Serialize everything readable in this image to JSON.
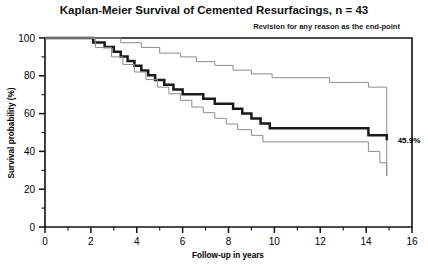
{
  "chart_data": {
    "type": "line",
    "title": "Kaplan-Meier Survival of Cemented Resurfacings, n = 43",
    "subtitle": "Revision for any reason as the end-point",
    "xlabel": "Follow-up in years",
    "ylabel": "Survival probability (%)",
    "xlim": [
      0,
      16
    ],
    "ylim": [
      0,
      100
    ],
    "x_ticks": [
      0,
      2,
      4,
      6,
      8,
      10,
      12,
      14,
      16
    ],
    "x_tick_labels": [
      "0",
      "2",
      "4",
      "6",
      "8",
      "10",
      "12",
      "14",
      "16"
    ],
    "x_minor_step": 1,
    "y_ticks": [
      0,
      20,
      40,
      60,
      80,
      100
    ],
    "y_tick_labels": [
      "0",
      "20",
      "40",
      "60",
      "80",
      "100"
    ],
    "y_minor_step": 10,
    "grid": false,
    "legend": "none",
    "step_type": "post",
    "annotations": [
      {
        "name": "final-survival-label",
        "text": "45.9%",
        "x": 15.2,
        "y": 45.9
      }
    ],
    "series": [
      {
        "name": "Survival estimate",
        "role": "estimate",
        "style": "bold",
        "color": "#1a1a1a",
        "final_value": 45.9,
        "x": [
          0.0,
          1.75,
          2.1,
          2.6,
          3.0,
          3.3,
          3.6,
          3.9,
          4.2,
          4.5,
          4.8,
          5.2,
          5.6,
          6.0,
          6.4,
          6.9,
          7.4,
          7.8,
          8.2,
          8.6,
          9.0,
          9.4,
          9.8,
          11.3,
          13.6,
          14.1,
          14.9
        ],
        "y": [
          100.0,
          100.0,
          97.6,
          95.2,
          92.7,
          90.2,
          87.8,
          85.3,
          82.8,
          80.3,
          77.8,
          75.3,
          72.8,
          70.3,
          70.3,
          67.8,
          65.2,
          65.2,
          62.6,
          60.0,
          57.4,
          54.8,
          52.2,
          52.2,
          52.2,
          48.5,
          45.9
        ]
      },
      {
        "name": "Upper 95% confidence limit",
        "role": "upper-ci",
        "style": "thin",
        "color": "#8d8d8d",
        "final_value": 71.5,
        "x": [
          0.0,
          2.6,
          3.3,
          4.2,
          5.0,
          5.9,
          6.6,
          7.4,
          8.2,
          9.0,
          9.9,
          11.3,
          12.4,
          13.6,
          14.1,
          14.9
        ],
        "y": [
          100.0,
          100.0,
          97.5,
          95.0,
          92.0,
          90.0,
          87.5,
          85.5,
          83.0,
          81.0,
          79.0,
          79.0,
          76.5,
          76.5,
          74.0,
          71.5
        ]
      },
      {
        "name": "Lower 95% confidence limit",
        "role": "lower-ci",
        "style": "thin",
        "color": "#8d8d8d",
        "final_value": 27.0,
        "x": [
          0.0,
          1.75,
          2.2,
          2.9,
          3.4,
          3.9,
          4.4,
          4.9,
          5.4,
          5.9,
          6.4,
          6.9,
          7.4,
          7.9,
          8.4,
          9.0,
          9.5,
          11.3,
          13.6,
          14.1,
          14.6,
          14.9
        ],
        "y": [
          100.0,
          100.0,
          95.0,
          90.0,
          86.0,
          82.0,
          78.0,
          74.0,
          70.5,
          67.0,
          63.5,
          60.5,
          57.5,
          54.5,
          51.5,
          48.5,
          45.0,
          45.0,
          45.0,
          40.0,
          34.0,
          27.0
        ]
      }
    ]
  },
  "plot_geometry": {
    "left": 45,
    "right": 412,
    "top": 38,
    "bottom": 227
  }
}
